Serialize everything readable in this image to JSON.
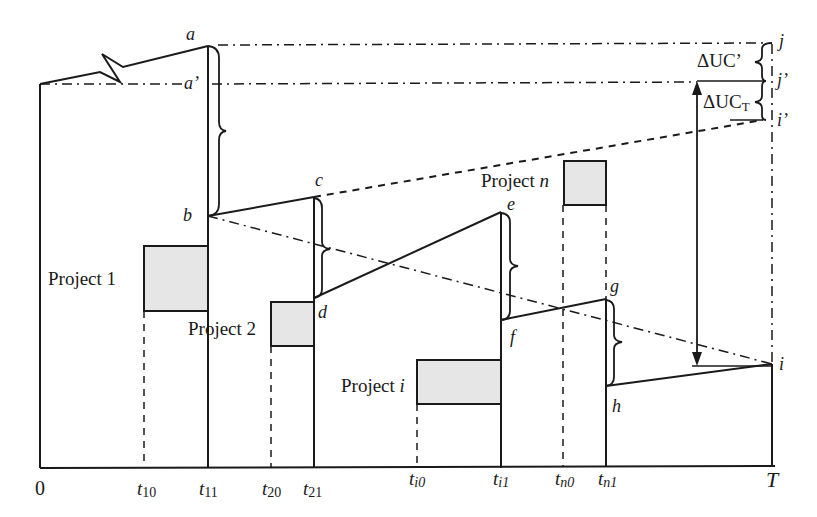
{
  "diagram": {
    "type": "inventory-level sawtooth diagram",
    "colors": {
      "line": "#1a1a1a",
      "box_fill": "#e6e6e6",
      "background": "#ffffff"
    },
    "axis": {
      "origin_label": "0",
      "end_label": "T",
      "ticks": [
        {
          "base": "t",
          "sub": "10"
        },
        {
          "base": "t",
          "sub": "11"
        },
        {
          "base": "t",
          "sub": "20"
        },
        {
          "base": "t",
          "sub": "21"
        },
        {
          "base": "t",
          "sub": "i0",
          "sub_italic_first": true
        },
        {
          "base": "t",
          "sub": "i1",
          "sub_italic_first": true
        },
        {
          "base": "t",
          "sub": "n0",
          "sub_italic_first": true
        },
        {
          "base": "t",
          "sub": "n1",
          "sub_italic_first": true
        }
      ]
    },
    "points": {
      "a": "a",
      "a_prime": "a’",
      "b": "b",
      "c": "c",
      "d": "d",
      "e": "e",
      "f": "f",
      "g": "g",
      "h": "h",
      "i": "i",
      "i_prime": "i’",
      "j": "j",
      "j_prime": "j’"
    },
    "projects": [
      {
        "prefix": "Project ",
        "name": "1",
        "italic": false
      },
      {
        "prefix": "Project ",
        "name": "2",
        "italic": false
      },
      {
        "prefix": "Project ",
        "name": "i",
        "italic": true
      },
      {
        "prefix": "Project ",
        "name": "n",
        "italic": true
      }
    ],
    "annotations": {
      "delta_uc_prime": "ΔUC’",
      "delta_uc_t_main": "ΔUC",
      "delta_uc_t_sub": "T"
    }
  }
}
